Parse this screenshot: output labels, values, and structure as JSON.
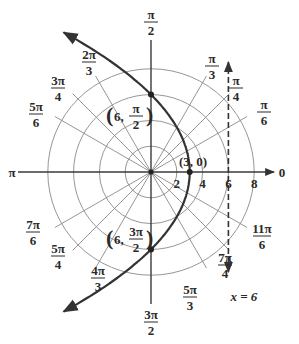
{
  "chart_data": {
    "type": "line",
    "title": "",
    "subtitle": "",
    "coordinate_system": "polar",
    "equation": "r = 6 / (1 + cos θ)",
    "radial_ticks": [
      2,
      4,
      6,
      8
    ],
    "radial_range": [
      0,
      8
    ],
    "grid": true,
    "angle_labels": [
      {
        "key": "a0",
        "num": "0",
        "den": ""
      },
      {
        "key": "a30",
        "num": "π",
        "den": "6"
      },
      {
        "key": "a45",
        "num": "π",
        "den": "4"
      },
      {
        "key": "a60",
        "num": "π",
        "den": "3"
      },
      {
        "key": "a90",
        "num": "π",
        "den": "2"
      },
      {
        "key": "a120",
        "num": "2π",
        "den": "3"
      },
      {
        "key": "a135",
        "num": "3π",
        "den": "4"
      },
      {
        "key": "a150",
        "num": "5π",
        "den": "6"
      },
      {
        "key": "a180",
        "num": "π",
        "den": ""
      },
      {
        "key": "a210",
        "num": "7π",
        "den": "6"
      },
      {
        "key": "a225",
        "num": "5π",
        "den": "4"
      },
      {
        "key": "a240",
        "num": "4π",
        "den": "3"
      },
      {
        "key": "a270",
        "num": "3π",
        "den": "2"
      },
      {
        "key": "a300",
        "num": "5π",
        "den": "3"
      },
      {
        "key": "a315",
        "num": "7π",
        "den": "4"
      },
      {
        "key": "a330",
        "num": "11π",
        "den": "6"
      }
    ],
    "series": [
      {
        "name": "parabola",
        "description": "r = 6/(1+cos θ), opening left, vertex at (3, 0)",
        "theta_range_deg": [
          -122,
          122
        ],
        "arrows_at_ends": true
      }
    ],
    "points": [
      {
        "label_r": "3",
        "label_theta": "0",
        "r": 3,
        "theta_deg": 0,
        "text": "(3, 0)"
      },
      {
        "label_r": "6",
        "label_theta_num": "π",
        "label_theta_den": "2",
        "r": 6,
        "theta_deg": 90,
        "text": "(6, π/2)"
      },
      {
        "label_r": "6",
        "label_theta_num": "3π",
        "label_theta_den": "2",
        "r": 6,
        "theta_deg": 270,
        "text": "(6, 3π/2)"
      }
    ],
    "directrix": {
      "x": 6,
      "label": "x = 6",
      "style": "dashed",
      "arrows": "both"
    }
  }
}
